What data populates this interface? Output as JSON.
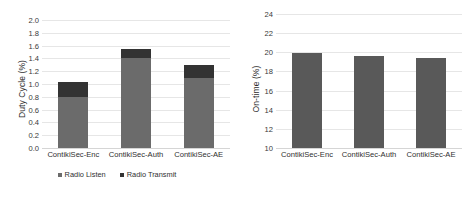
{
  "chart_data": [
    {
      "type": "bar",
      "id": "duty-cycle",
      "title": "",
      "xlabel": "",
      "ylabel": "Duty Cycle (%)",
      "ylim": [
        0.0,
        2.0
      ],
      "ystep": 0.2,
      "ytick_labels": [
        "0.0",
        "0.2",
        "0.4",
        "0.6",
        "0.8",
        "1.0",
        "1.2",
        "1.4",
        "1.6",
        "1.8",
        "2.0"
      ],
      "grid": true,
      "stacked": true,
      "legend_position": "bottom",
      "categories": [
        "ContikiSec-Enc",
        "ContikiSec-Auth",
        "ContikiSec-AE"
      ],
      "series": [
        {
          "name": "Radio Listen",
          "values": [
            0.8,
            1.4,
            1.1
          ]
        },
        {
          "name": "Radio Transmit",
          "values": [
            0.23,
            0.14,
            0.2
          ]
        }
      ],
      "totals": [
        1.03,
        1.54,
        1.3
      ],
      "colors": {
        "Radio Listen": "#6b6b6b",
        "Radio Transmit": "#333333"
      }
    },
    {
      "type": "bar",
      "id": "on-time",
      "title": "",
      "xlabel": "",
      "ylabel": "On-time (%)",
      "ylim": [
        10,
        24
      ],
      "ystep": 2,
      "ytick_labels": [
        "10",
        "12",
        "14",
        "16",
        "18",
        "20",
        "22",
        "24"
      ],
      "grid": true,
      "stacked": false,
      "legend_position": "none",
      "categories": [
        "ContikiSec-Enc",
        "ContikiSec-Auth",
        "ContikiSec-AE"
      ],
      "values": [
        19.9,
        19.65,
        19.4
      ],
      "colors": {
        "bar": "#595959"
      }
    }
  ]
}
